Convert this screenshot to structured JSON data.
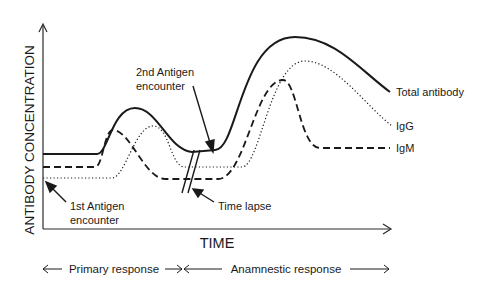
{
  "diagram": {
    "y_axis_label": "ANTIBODY CONCENTRATION",
    "x_axis_label": "TIME",
    "curves": [
      {
        "name": "Total antibody",
        "style": "solid"
      },
      {
        "name": "IgG",
        "style": "dotted"
      },
      {
        "name": "IgM",
        "style": "dashed"
      }
    ],
    "annotations": {
      "first_antigen_line1": "1st Antigen",
      "first_antigen_line2": "encounter",
      "second_antigen_line1": "2nd Antigen",
      "second_antigen_line2": "encounter",
      "time_lapse": "Time lapse"
    },
    "phases": {
      "primary": "Primary response",
      "anamnestic": "Anamnestic response"
    },
    "colors": {
      "ink": "#1a1a1a",
      "background": "#ffffff"
    }
  }
}
